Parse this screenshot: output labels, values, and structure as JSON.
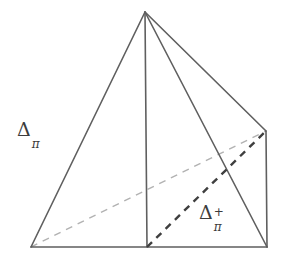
{
  "figure": {
    "background_color": "#ffffff",
    "width": 283,
    "height": 267,
    "stroke_color_solid": "#5f5f5f",
    "stroke_color_dashed_light": "#b2b2b2",
    "stroke_color_dashed_bold": "#3f3f3f",
    "label_color": "#3c3c3c",
    "vertices": {
      "apex": [
        145,
        12
      ],
      "bottom_left": [
        31,
        247
      ],
      "bottom_center": [
        147,
        247
      ],
      "bottom_right": [
        267,
        247
      ],
      "right_back": [
        266,
        131
      ]
    },
    "edges_solid": [
      {
        "name": "apex-to-bottom-left",
        "from": [
          145,
          12
        ],
        "to": [
          31,
          247
        ]
      },
      {
        "name": "base-bottom",
        "from": [
          31,
          247
        ],
        "to": [
          267,
          247
        ]
      },
      {
        "name": "apex-to-bottom-center-vertical",
        "from": [
          145,
          12
        ],
        "to": [
          147,
          247
        ]
      },
      {
        "name": "apex-to-right-back",
        "from": [
          145,
          12
        ],
        "to": [
          266,
          131
        ]
      },
      {
        "name": "apex-to-bottom-right",
        "from": [
          145,
          12
        ],
        "to": [
          267,
          247
        ]
      },
      {
        "name": "right-back-to-bottom-right",
        "from": [
          266,
          131
        ],
        "to": [
          267,
          247
        ]
      }
    ],
    "edges_dashed": [
      {
        "name": "hidden-diagonal-light",
        "from": [
          31,
          247
        ],
        "to": [
          266,
          131
        ],
        "style": "light",
        "color": "#b2b2b2",
        "width": 1.4,
        "dasharray": "7 6"
      },
      {
        "name": "hidden-diagonal-bold",
        "from": [
          147,
          247
        ],
        "to": [
          266,
          131
        ],
        "style": "bold",
        "color": "#3f3f3f",
        "width": 2.4,
        "dasharray": "7 6"
      }
    ],
    "labels": {
      "delta_pi": {
        "base": "Δ",
        "sub": "π",
        "sup": "",
        "x": 17,
        "y": 120
      },
      "delta_pi_plus": {
        "base": "Δ",
        "sub": "π",
        "sup": "+",
        "x": 199,
        "y": 203
      }
    }
  }
}
